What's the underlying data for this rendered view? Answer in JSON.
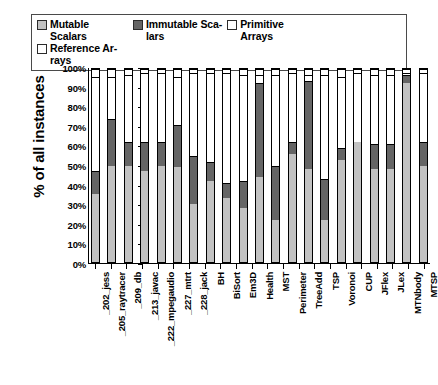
{
  "chart_data": {
    "type": "bar",
    "subtype": "stacked-bar-100-percent",
    "title": "",
    "xlabel": "",
    "ylabel": "% of all instances",
    "ylim": [
      0,
      100
    ],
    "ytick_labels": [
      "100%",
      "90%",
      "80%",
      "70%",
      "60%",
      "50%",
      "40%",
      "30%",
      "20%",
      "10%",
      "0%"
    ],
    "ytick_values": [
      100,
      90,
      80,
      70,
      60,
      50,
      40,
      30,
      20,
      10,
      0
    ],
    "grid": false,
    "legend_position": "top",
    "categories": [
      "_202_jess",
      "_205_raytracer",
      "_209_db",
      "_213_javac",
      "_222_mpegaudio",
      "_227_mtrt",
      "_228_jack",
      "BH",
      "BiSort",
      "Em3D",
      "Health",
      "MST",
      "Perimeter",
      "TreeAdd",
      "TSP",
      "Voronoi",
      "CUP",
      "JFlex",
      "JLex",
      "MTNbody",
      "MTSP"
    ],
    "series": [
      {
        "name": "Mutable Scalars",
        "color": "#c2c2c2",
        "values": [
          35,
          50,
          50,
          47,
          50,
          49,
          30,
          42,
          33,
          28,
          44,
          22,
          56,
          48,
          22,
          53,
          62,
          48,
          48,
          93,
          50
        ]
      },
      {
        "name": "Immutable Scalars",
        "color": "#656565",
        "values": [
          12,
          24,
          12,
          15,
          12,
          22,
          25,
          10,
          8,
          14,
          49,
          28,
          6,
          46,
          21,
          6,
          0,
          13,
          13,
          4,
          12
        ]
      },
      {
        "name": "Primitive Arrays",
        "color": "#ffffff",
        "values": [
          49,
          22,
          35,
          36,
          36,
          25,
          43,
          46,
          57,
          55,
          4,
          47,
          36,
          3,
          54,
          37,
          36,
          36,
          36,
          1,
          36
        ]
      },
      {
        "name": "Reference Arrays",
        "color": "#ffffff",
        "values": [
          4,
          4,
          3,
          2,
          2,
          4,
          2,
          2,
          2,
          3,
          3,
          3,
          2,
          3,
          3,
          4,
          2,
          3,
          3,
          2,
          2
        ]
      }
    ]
  },
  "legend": {
    "items": [
      {
        "label": "Mutable Scalars",
        "swatch": "#c2c2c2"
      },
      {
        "label": "Immutable Sca-\nlars",
        "swatch": "#656565"
      },
      {
        "label": "Primitive Arrays",
        "swatch": "#ffffff"
      },
      {
        "label": "Reference Ar-\nrays",
        "swatch": "#ffffff"
      }
    ]
  },
  "axis": {
    "y_title": "% of all instances"
  }
}
